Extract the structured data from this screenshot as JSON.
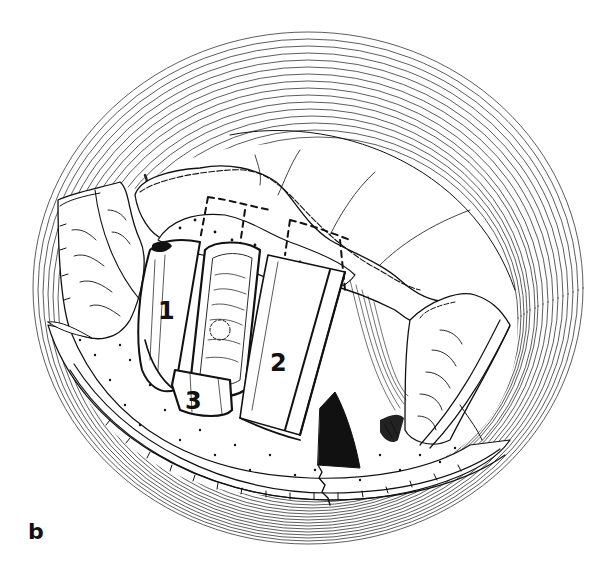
{
  "figure": {
    "panel_label": "b",
    "style": "black-and-white surgical line illustration",
    "ink_color": "#111111",
    "paper_color": "#ffffff",
    "numbered_regions": [
      {
        "id": "1",
        "label": "1",
        "x": 158,
        "y": 299
      },
      {
        "id": "2",
        "label": "2",
        "x": 270,
        "y": 351
      },
      {
        "id": "3",
        "label": "3",
        "x": 185,
        "y": 389
      }
    ],
    "elements": [
      "outer-concentric-ring",
      "upper-tissue-flap-with-dashed-outline",
      "left-retracted-flap",
      "right-retracted-flap",
      "cylindrical-segment-1",
      "cylindrical-segment-central-textured",
      "cylindrical-segment-2",
      "segment-3",
      "dotted-floor-region",
      "dark-cavity",
      "sutured-seam"
    ]
  }
}
